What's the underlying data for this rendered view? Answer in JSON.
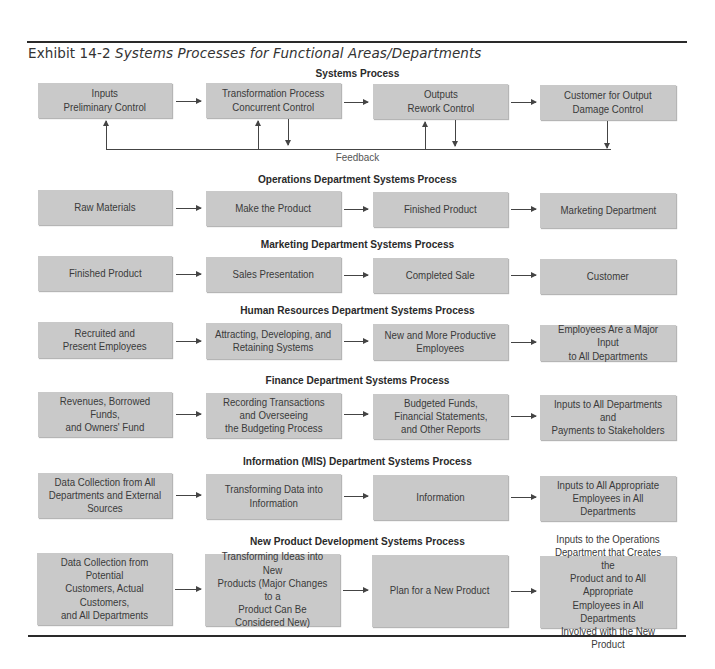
{
  "exhibit": {
    "number": "Exhibit 14-2",
    "title": "Systems Processes for Functional Areas/Departments"
  },
  "feedback_label": "Feedback",
  "sections": [
    {
      "title": "Systems Process",
      "boxes": [
        "Inputs\nPreliminary Control",
        "Transformation Process\nConcurrent Control",
        "Outputs\nRework Control",
        "Customer for Output\nDamage Control"
      ]
    },
    {
      "title": "Operations Department Systems Process",
      "boxes": [
        "Raw Materials",
        "Make the Product",
        "Finished Product",
        "Marketing Department"
      ]
    },
    {
      "title": "Marketing Department Systems Process",
      "boxes": [
        "Finished Product",
        "Sales Presentation",
        "Completed Sale",
        "Customer"
      ]
    },
    {
      "title": "Human Resources Department Systems Process",
      "boxes": [
        "Recruited and\nPresent Employees",
        "Attracting, Developing, and\nRetaining Systems",
        "New and More Productive\nEmployees",
        "Employees Are a Major Input\nto All Departments"
      ]
    },
    {
      "title": "Finance Department Systems Process",
      "boxes": [
        "Revenues, Borrowed Funds,\nand Owners' Fund",
        "Recording Transactions\nand Overseeing\nthe Budgeting Process",
        "Budgeted Funds,\nFinancial Statements,\nand Other Reports",
        "Inputs to All Departments and\nPayments to Stakeholders"
      ]
    },
    {
      "title": "Information (MIS) Department Systems Process",
      "boxes": [
        "Data Collection from All\nDepartments and External\nSources",
        "Transforming Data into\nInformation",
        "Information",
        "Inputs to All Appropriate\nEmployees in All Departments"
      ]
    },
    {
      "title": "New Product Development Systems Process",
      "boxes": [
        "Data Collection from Potential\nCustomers, Actual Customers,\nand All Departments",
        "Transforming Ideas into New\nProducts (Major Changes to a\nProduct Can Be\nConsidered New)",
        "Plan for a New Product",
        "Inputs to the Operations\nDepartment that Creates the\nProduct and to All Appropriate\nEmployees in All Departments\nInvolved with the New Product"
      ]
    }
  ]
}
